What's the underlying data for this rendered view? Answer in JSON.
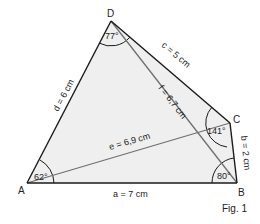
{
  "figure": {
    "caption": "Fig. 1",
    "fill_color": "#efefef",
    "edge_color": "#1a1a1a",
    "diagonal_color": "#707070",
    "vertices": [
      {
        "name": "A",
        "x": 27,
        "y": 183
      },
      {
        "name": "B",
        "x": 237,
        "y": 183
      },
      {
        "name": "C",
        "x": 230,
        "y": 123
      },
      {
        "name": "D",
        "x": 111,
        "y": 21
      }
    ],
    "sides": [
      {
        "name": "a",
        "label": "a = 7 cm"
      },
      {
        "name": "b",
        "label": "b = 2 cm"
      },
      {
        "name": "c",
        "label": "c = 5 cm"
      },
      {
        "name": "d",
        "label": "d = 6 cm"
      }
    ],
    "diagonals": [
      {
        "name": "e",
        "label": "e = 6,9 cm"
      },
      {
        "name": "f",
        "label": "f = 6,7 cm"
      }
    ],
    "angles": [
      {
        "vertex": "A",
        "label": "62°"
      },
      {
        "vertex": "B",
        "label": "80°"
      },
      {
        "vertex": "C",
        "label": "141°"
      },
      {
        "vertex": "D",
        "label": "77°"
      }
    ]
  }
}
